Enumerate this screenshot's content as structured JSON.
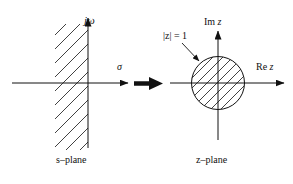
{
  "figure": {
    "ink_color": "#111111",
    "background": "#ffffff"
  },
  "left_plane": {
    "caption": "s–plane",
    "vertical_axis_label": "jω",
    "horizontal_axis_label": "σ",
    "region_description": "hatched strip left of the jω axis",
    "hatch_angle_deg": 45
  },
  "transform_arrow": {
    "name": "maps-to-arrow",
    "direction": "right"
  },
  "right_plane": {
    "caption": "z–plane",
    "vertical_axis_label_roman": "Im",
    "vertical_axis_label_italic": "z",
    "horizontal_axis_label_roman": "Re",
    "horizontal_axis_label_italic": "z",
    "circle_label_bar": "|",
    "circle_label_var": "z",
    "circle_label_rest": "| = 1",
    "circle_label_full": "|z| = 1",
    "circle_radius_value": 1,
    "region_description": "hatched interior of the unit circle",
    "hatch_angle_deg": 45
  }
}
